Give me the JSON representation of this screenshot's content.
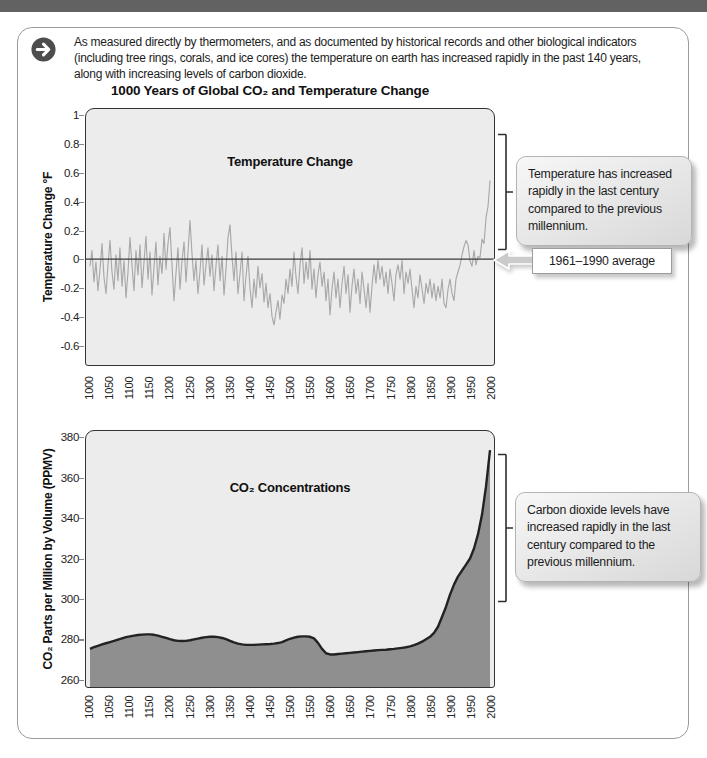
{
  "intro": {
    "icon": "arrow-right-circle-icon",
    "text": "As measured directly by thermometers, and as documented by historical records and other biological indicators\n(including tree rings, corals, and ice cores) the temperature on earth has increased rapidly in the past 140 years,\nalong with increasing levels of carbon dioxide."
  },
  "figure_title": "1000 Years of Global CO₂ and Temperature Change",
  "callouts": {
    "temperature": "Temperature has increased rapidly in the last century compared to the previous millennium.",
    "co2": "Carbon dioxide levels have increased rapidly in the last century compared to the previous millennium.",
    "average": "1961–1990 average"
  },
  "colors": {
    "top_bar": "#626262",
    "panel_border": "#9b9b9b",
    "plot_background": "#ececec",
    "plot_frame": "#333333",
    "temperature_series": "#a8a8a8",
    "reference_line": "#3a3a3a",
    "co2_line": "#222222",
    "co2_fill": "#8f8f8f",
    "callout_border": "#b3b3b3"
  },
  "chart_data": [
    {
      "type": "line",
      "title": "Temperature Change",
      "ylabel": "Temperature Change °F",
      "x_range": [
        1000,
        2000
      ],
      "y_range": [
        -0.74,
        1.05
      ],
      "x_ticks": [
        1000,
        1050,
        1100,
        1150,
        1200,
        1250,
        1300,
        1350,
        1400,
        1450,
        1500,
        1550,
        1600,
        1650,
        1700,
        1750,
        1800,
        1850,
        1900,
        1950,
        2000
      ],
      "y_ticks": [
        1,
        0.8,
        0.6,
        0.4,
        0.2,
        0,
        -0.2,
        -0.4,
        -0.6
      ],
      "x_start": 1000,
      "x_step": 5,
      "values": [
        -0.05,
        0.06,
        -0.16,
        -0.02,
        -0.22,
        -0.07,
        0.11,
        -0.13,
        -0.24,
        -0.04,
        0.13,
        -0.09,
        -0.21,
        0.03,
        -0.15,
        0.08,
        -0.19,
        -0.01,
        -0.27,
        -0.09,
        0.15,
        -0.04,
        -0.22,
        0.06,
        -0.11,
        0.1,
        -0.2,
        -0.02,
        0.16,
        -0.14,
        0.05,
        -0.25,
        -0.06,
        0.12,
        -0.18,
        0.02,
        -0.1,
        0.18,
        -0.07,
        0.11,
        0.22,
        -0.04,
        -0.29,
        -0.1,
        0.08,
        -0.21,
        -0.01,
        0.12,
        -0.16,
        0.05,
        0.27,
        0.04,
        -0.15,
        -0.01,
        -0.24,
        -0.08,
        0.1,
        -0.18,
        -0.04,
        0.08,
        -0.12,
        0.03,
        -0.22,
        -0.05,
        0.1,
        -0.15,
        0.02,
        -0.25,
        -0.07,
        0.15,
        0.24,
        0.02,
        -0.15,
        0.05,
        -0.24,
        -0.1,
        0.05,
        -0.29,
        -0.12,
        0.02,
        -0.2,
        -0.34,
        -0.14,
        -0.27,
        -0.05,
        -0.2,
        -0.1,
        -0.3,
        -0.17,
        -0.34,
        -0.24,
        -0.4,
        -0.46,
        -0.37,
        -0.29,
        -0.42,
        -0.25,
        -0.31,
        -0.14,
        -0.24,
        -0.07,
        -0.19,
        0.05,
        -0.12,
        -0.24,
        -0.04,
        0.08,
        -0.17,
        -0.02,
        -0.14,
        0.06,
        -0.21,
        -0.07,
        -0.27,
        -0.11,
        -0.02,
        -0.19,
        -0.09,
        -0.29,
        -0.14,
        -0.39,
        -0.21,
        -0.09,
        -0.27,
        -0.14,
        -0.34,
        -0.17,
        -0.05,
        -0.24,
        -0.11,
        -0.37,
        -0.19,
        -0.07,
        -0.24,
        -0.14,
        -0.31,
        -0.09,
        -0.21,
        -0.34,
        -0.17,
        -0.37,
        -0.19,
        -0.04,
        -0.17,
        -0.01,
        -0.14,
        -0.05,
        -0.19,
        -0.09,
        -0.24,
        -0.07,
        -0.17,
        -0.29,
        -0.11,
        -0.04,
        -0.14,
        -0.01,
        -0.24,
        -0.09,
        -0.17,
        -0.07,
        -0.21,
        -0.34,
        -0.19,
        -0.27,
        -0.11,
        -0.21,
        -0.31,
        -0.17,
        -0.24,
        -0.14,
        -0.27,
        -0.17,
        -0.29,
        -0.19,
        -0.27,
        -0.14,
        -0.31,
        -0.34,
        -0.21,
        -0.14,
        -0.24,
        -0.29,
        -0.14,
        -0.09,
        -0.04,
        0.03,
        0.09,
        0.13,
        0.1,
        -0.01,
        -0.05,
        0.06,
        -0.04,
        0.02,
        0.01,
        0.14,
        0.11,
        0.29,
        0.37,
        0.55
      ],
      "reference_line": {
        "value": 0,
        "label": "1961–1990 average"
      },
      "series_color": "#a8a8a8",
      "grid": false,
      "legend": "none"
    },
    {
      "type": "area",
      "title": "CO₂ Concentrations",
      "ylabel": "CO₂ Parts per Million by Volume (PPMV)",
      "x_range": [
        1000,
        2000
      ],
      "y_range": [
        256,
        383.5
      ],
      "x_ticks": [
        1000,
        1050,
        1100,
        1150,
        1200,
        1250,
        1300,
        1350,
        1400,
        1450,
        1500,
        1550,
        1600,
        1650,
        1700,
        1750,
        1800,
        1850,
        1900,
        1950,
        2000
      ],
      "y_ticks": [
        380,
        360,
        340,
        320,
        300,
        280,
        260
      ],
      "x_start": 1000,
      "x_step": 10,
      "values": [
        275.0,
        275.8,
        276.5,
        277.2,
        277.8,
        278.4,
        279.0,
        279.6,
        280.2,
        280.8,
        281.2,
        281.6,
        281.9,
        282.1,
        282.2,
        282.2,
        282.0,
        281.6,
        281.0,
        280.4,
        279.8,
        279.3,
        279.0,
        278.9,
        279.0,
        279.3,
        279.7,
        280.1,
        280.5,
        280.8,
        281.0,
        281.0,
        280.8,
        280.4,
        279.8,
        279.0,
        278.2,
        277.6,
        277.2,
        277.0,
        277.0,
        277.0,
        277.1,
        277.2,
        277.3,
        277.4,
        277.6,
        277.9,
        278.4,
        279.2,
        280.0,
        280.6,
        281.0,
        281.2,
        281.2,
        281.0,
        280.2,
        278.0,
        275.0,
        272.8,
        272.2,
        272.2,
        272.4,
        272.6,
        272.8,
        273.0,
        273.2,
        273.4,
        273.6,
        273.8,
        274.0,
        274.2,
        274.4,
        274.5,
        274.6,
        274.8,
        275.0,
        275.2,
        275.5,
        275.8,
        276.2,
        276.8,
        277.6,
        278.6,
        279.8,
        281.0,
        283.0,
        286.0,
        291.0,
        296.0,
        302.0,
        307.0,
        311.0,
        314.0,
        317.0,
        320.0,
        325.0,
        332.0,
        342.0,
        356.0,
        374.0
      ],
      "line_color": "#222222",
      "fill_color": "#8f8f8f",
      "grid": false,
      "legend": "none"
    }
  ]
}
